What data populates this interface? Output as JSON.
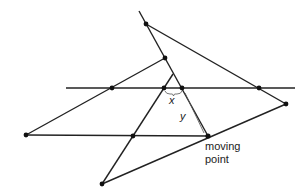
{
  "diagram": {
    "labels": {
      "x": "x",
      "y": "y",
      "moving_point_line1": "moving",
      "moving_point_line2": "point"
    },
    "colors": {
      "line": "#222222",
      "point": "#111111",
      "background": "#ffffff"
    },
    "point_count": 11
  }
}
